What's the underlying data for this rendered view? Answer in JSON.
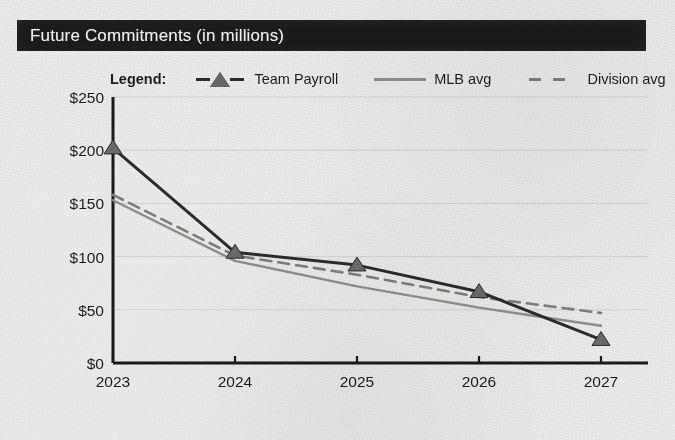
{
  "title": "Future Commitments (in millions)",
  "legend": {
    "heading": "Legend:",
    "entries": [
      {
        "label": "Team Payroll",
        "style": "solid-dark-with-triangle-markers",
        "color": "#2b2b2b"
      },
      {
        "label": "MLB avg",
        "style": "solid",
        "color": "#8e8e8a"
      },
      {
        "label": "Division avg",
        "style": "dashed",
        "color": "#7d7d79"
      }
    ]
  },
  "axes": {
    "y_ticks": [
      "$0",
      "$50",
      "$100",
      "$150",
      "$200",
      "$250"
    ],
    "x_ticks": [
      "2023",
      "2024",
      "2025",
      "2026",
      "2027"
    ]
  },
  "chart_data": {
    "type": "line",
    "title": "Future Commitments (in millions)",
    "xlabel": "",
    "ylabel": "",
    "categories": [
      "2023",
      "2024",
      "2025",
      "2026",
      "2027"
    ],
    "x": [
      2023,
      2024,
      2025,
      2026,
      2027
    ],
    "ylim": [
      0,
      250
    ],
    "ytick_values": [
      0,
      50,
      100,
      150,
      200,
      250
    ],
    "ytick_labels": [
      "$0",
      "$50",
      "$100",
      "$150",
      "$200",
      "$250"
    ],
    "grid": true,
    "grid_axis": "y",
    "legend_position": "above-plot",
    "units": "millions of US dollars",
    "series": [
      {
        "name": "Team Payroll",
        "values": [
          202,
          104,
          92,
          67,
          22
        ],
        "color": "#2b2b2b",
        "line_style": "solid",
        "line_width": 3,
        "marker": "triangle",
        "marker_color": "#6a6a66"
      },
      {
        "name": "MLB avg",
        "values": [
          153,
          96,
          72,
          52,
          35
        ],
        "color": "#8e8e8a",
        "line_style": "solid",
        "line_width": 2.4,
        "marker": "none"
      },
      {
        "name": "Division avg",
        "values": [
          158,
          101,
          83,
          62,
          47
        ],
        "color": "#7d7d79",
        "line_style": "dashed",
        "line_width": 2.6,
        "marker": "none"
      }
    ]
  }
}
